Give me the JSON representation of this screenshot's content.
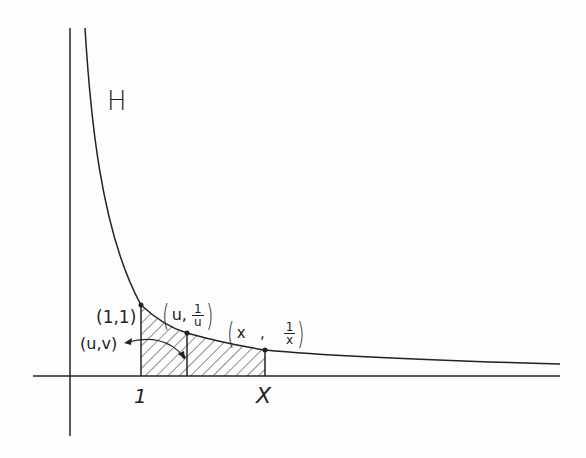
{
  "diagram": {
    "region_label": "H",
    "axis_tick_labels": [
      "1",
      "X"
    ],
    "points": [
      {
        "id": "p11",
        "label": "(1,1)"
      },
      {
        "id": "puv",
        "label": "(u,v)"
      },
      {
        "id": "pu1u",
        "label_left": "u",
        "label_sep": ",",
        "num": "1",
        "den": "u"
      },
      {
        "id": "px1x",
        "label_left": "x",
        "label_sep": ",",
        "num": "1",
        "den": "x"
      }
    ],
    "curve": "y = 1/x",
    "shaded_region": "area under curve from 1 to x (hatched)",
    "colors": {
      "ink": "#222222",
      "paper": "#fdfdfd"
    }
  }
}
